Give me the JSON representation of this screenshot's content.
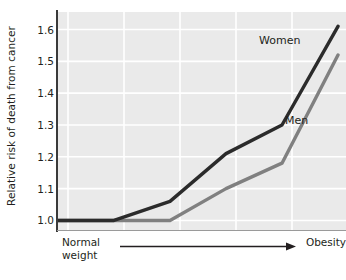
{
  "chart_data": {
    "type": "line",
    "title": "",
    "subtitle": "",
    "xlabel": "",
    "ylabel": "Relative risk of death from cancer",
    "x": [
      0,
      1,
      2,
      3,
      4,
      5
    ],
    "xtick_labels": [
      "",
      "",
      "",
      "",
      "",
      ""
    ],
    "ylim": [
      0.97,
      1.655
    ],
    "yticks": [
      1.0,
      1.1,
      1.2,
      1.3,
      1.4,
      1.5,
      1.6
    ],
    "ytick_labels": [
      "1.0",
      "1.1",
      "1.2",
      "1.3",
      "1.4",
      "1.5",
      "1.6"
    ],
    "grid": true,
    "grid_color": "#ffffff",
    "plot_background": "#eaeaea",
    "legend": "inline-labels",
    "axis_annotation": {
      "left_line1": "Normal",
      "left_line2": "weight",
      "right": "Obesity",
      "arrow_direction": "right"
    },
    "series": [
      {
        "name": "Women",
        "color": "#2b2b2b",
        "values": [
          1.0,
          1.0,
          1.06,
          1.21,
          1.3,
          1.61
        ]
      },
      {
        "name": "Men",
        "color": "#808080",
        "values": [
          1.0,
          1.0,
          1.0,
          1.1,
          1.18,
          1.52
        ]
      }
    ]
  },
  "labels": {
    "women": "Women",
    "men": "Men"
  }
}
